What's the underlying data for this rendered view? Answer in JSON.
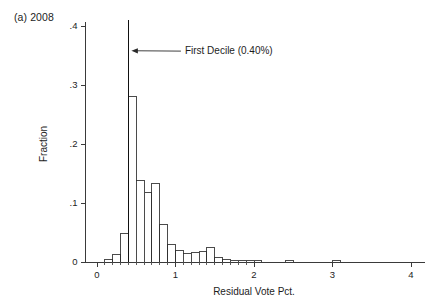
{
  "panel": {
    "label": "(a) 2008"
  },
  "chart_data": {
    "type": "bar",
    "title": "(a) 2008",
    "xlabel": "Residual Vote Pct.",
    "ylabel": "Fraction",
    "xlim": [
      -0.18,
      4.18
    ],
    "ylim": [
      0,
      0.42
    ],
    "xticks": [
      0,
      1,
      2,
      3,
      4
    ],
    "xtick_labels": [
      "0",
      "1",
      "2",
      "3",
      "4"
    ],
    "yticks": [
      0,
      0.1,
      0.2,
      0.3,
      0.4
    ],
    "ytick_labels": [
      "0",
      ".1",
      ".2",
      ".3",
      ".4"
    ],
    "xminor_step": 0.1,
    "grid": false,
    "legend": false,
    "bin_width": 0.1,
    "bin_left_edges": [
      0.1,
      0.2,
      0.3,
      0.4,
      0.5,
      0.6,
      0.7,
      0.8,
      0.9,
      1.0,
      1.1,
      1.2,
      1.3,
      1.4,
      1.5,
      1.6,
      1.7,
      1.8,
      1.9,
      2.0,
      2.4,
      3.0
    ],
    "values": [
      0.004,
      0.012,
      0.048,
      0.28,
      0.138,
      0.118,
      0.133,
      0.063,
      0.03,
      0.019,
      0.014,
      0.016,
      0.017,
      0.025,
      0.008,
      0.004,
      0.003,
      0.003,
      0.003,
      0.003,
      0.002,
      0.002
    ],
    "categories": [
      "0.1",
      "0.2",
      "0.3",
      "0.4",
      "0.5",
      "0.6",
      "0.7",
      "0.8",
      "0.9",
      "1.0",
      "1.1",
      "1.2",
      "1.3",
      "1.4",
      "1.5",
      "1.6",
      "1.7",
      "1.8",
      "1.9",
      "2.0",
      "2.4",
      "3.0"
    ],
    "annotations": [
      {
        "name": "first-decile",
        "text": "First Decile (0.40%)",
        "x": 0.4,
        "marker": "vertical-line",
        "marker_top": 0.41,
        "arrow": "left",
        "text_x": 1.12,
        "text_y": 0.352
      }
    ]
  }
}
